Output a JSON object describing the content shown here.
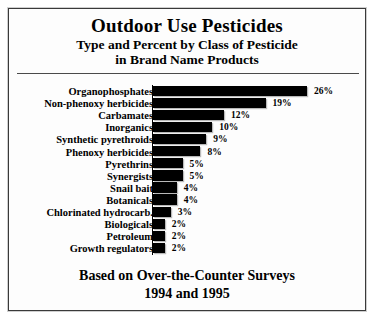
{
  "chart_data": {
    "type": "bar",
    "orientation": "horizontal",
    "title": "Outdoor Use Pesticides",
    "subtitle_line_1": "Type and Percent by Class of Pesticide",
    "subtitle_line_2": "in Brand Name Products",
    "footer_line_1": "Based on Over-the-Counter Surveys",
    "footer_line_2": "1994 and 1995",
    "xlabel": "",
    "ylabel": "",
    "xlim": [
      0,
      26
    ],
    "grid": false,
    "legend": "none",
    "value_suffix": "%",
    "categories": [
      "Organophosphates",
      "Non-phenoxy herbicides",
      "Carbamates",
      "Inorganics",
      "Synthetic pyrethroids",
      "Phenoxy herbicides",
      "Pyrethrins",
      "Synergists",
      "Snail bait",
      "Botanicals",
      "Chlorinated hydrocarb.",
      "Biologicals",
      "Petroleum",
      "Growth regulators"
    ],
    "values": [
      26,
      19,
      12,
      10,
      9,
      8,
      5,
      5,
      4,
      4,
      3,
      2,
      2,
      2
    ],
    "value_labels": [
      "26%",
      "19%",
      "12%",
      "10%",
      "9%",
      "8%",
      "5%",
      "5%",
      "4%",
      "4%",
      "3%",
      "2%",
      "2%",
      "2%"
    ],
    "bar_color": "#000000",
    "background_color": "#fdfdfd",
    "frame_color": "#3a3a3a"
  }
}
